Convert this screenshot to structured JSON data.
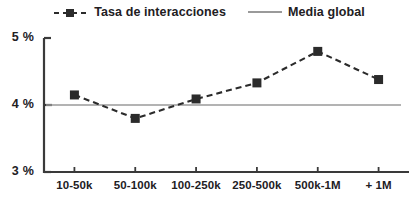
{
  "chart_data": {
    "type": "line",
    "title": "",
    "xlabel": "",
    "ylabel": "",
    "categories": [
      "10-50k",
      "50-100k",
      "100-250k",
      "250-500k",
      "500k-1M",
      "+ 1M"
    ],
    "series": [
      {
        "name": "Tasa de interacciones",
        "style": "dashed-line-with-square-markers",
        "color": "#2b2b2b",
        "values": [
          4.15,
          3.8,
          4.09,
          4.33,
          4.8,
          4.38
        ]
      },
      {
        "name": "Media global",
        "style": "solid-horizontal-reference-line",
        "color": "#9a9a9a",
        "value": 4.0
      }
    ],
    "ylim": [
      3,
      5
    ],
    "yticks": [
      3,
      4,
      5
    ],
    "ytick_labels": [
      "3 %",
      "4 %",
      "5 %"
    ],
    "grid": false,
    "legend_position": "top-center"
  },
  "legend": {
    "items": [
      {
        "label": "Tasa de interacciones",
        "key": "dashed-square-marker-key"
      },
      {
        "label": "Media global",
        "key": "solid-line-key"
      }
    ]
  },
  "colors": {
    "data_line": "#2b2b2b",
    "mean_line": "#9a9a9a",
    "axis": "#3a3a3a",
    "text": "#22201f",
    "background": "#ffffff"
  }
}
